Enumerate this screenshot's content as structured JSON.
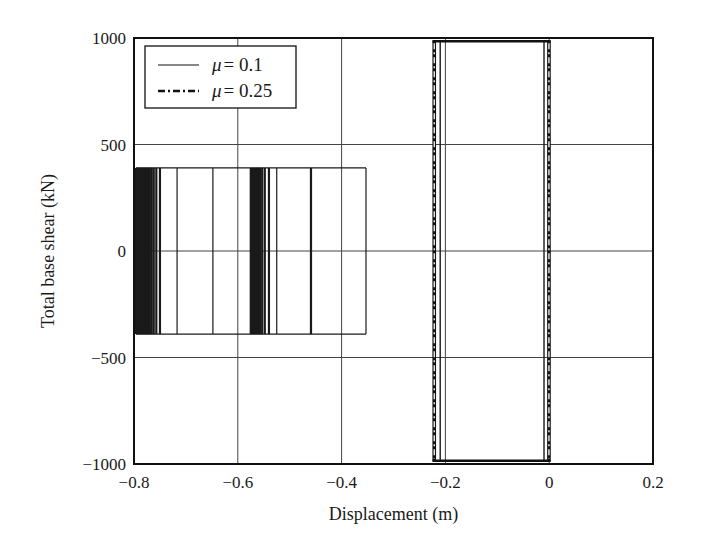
{
  "chart_data": {
    "type": "line",
    "title": "",
    "xlabel": "Displacement (m)",
    "ylabel": "Total base shear (kN)",
    "xlim": [
      -0.8,
      0.2
    ],
    "ylim": [
      -1000,
      1000
    ],
    "xticks": [
      -0.8,
      -0.6,
      -0.4,
      -0.2,
      0,
      0.2
    ],
    "xtick_labels": [
      "−0.8",
      "−0.6",
      "−0.4",
      "−0.2",
      "0",
      "0.2"
    ],
    "yticks": [
      1000,
      500,
      0,
      -500,
      -1000
    ],
    "ytick_labels": [
      "1000",
      "500",
      "0",
      "−500",
      "−1000"
    ],
    "grid": true,
    "legend_position": "upper left",
    "series": [
      {
        "name": "μ = 0.1",
        "legend_symbol": "μ",
        "legend_value": "= 0.1",
        "style": "solid",
        "color": "#1a1a1a",
        "description": "Rectangular friction hysteresis loops, shear capped at ±390 kN; successive vertical unloading/reloading branches drifting from about -0.8 m to -0.35 m, plus a loop near -0.21 to -0.01 m",
        "force_limit": 390,
        "vertical_branches_x": [
          -0.796,
          -0.793,
          -0.79,
          -0.787,
          -0.785,
          -0.782,
          -0.779,
          -0.776,
          -0.773,
          -0.77,
          -0.766,
          -0.762,
          -0.757,
          -0.75,
          -0.717,
          -0.648,
          -0.575,
          -0.572,
          -0.569,
          -0.566,
          -0.563,
          -0.56,
          -0.557,
          -0.553,
          -0.548,
          -0.54,
          -0.525,
          -0.46,
          -0.458,
          -0.353
        ],
        "right_end_x": -0.353,
        "loop2_x": [
          -0.21,
          -0.01
        ],
        "loop2_force": 985
      },
      {
        "name": "μ = 0.25",
        "legend_symbol": "μ",
        "legend_value": "= 0.25",
        "style": "dashdot",
        "color": "#1a1a1a",
        "description": "Near-rectangular hysteresis loop with shear capped at about ±985 kN between displacements of about -0.225 m and 0.005 m",
        "force_limit": 985,
        "vertical_branches_x": [
          -0.225,
          -0.218,
          -0.004,
          0.003
        ]
      }
    ]
  }
}
